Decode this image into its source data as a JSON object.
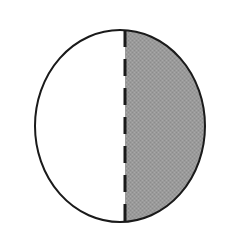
{
  "figure": {
    "name": "circle-divided-by-dashed-chord",
    "background_color": "#ffffff",
    "canvas": {
      "width": 230,
      "height": 240
    },
    "circle": {
      "center_x": 120,
      "center_y": 126,
      "radius_x": 85,
      "radius_y": 96,
      "outline_color": "#1a1a1a",
      "outline_width": 2,
      "fill_color": "#ffffff"
    },
    "divider": {
      "type": "vertical-dashed-line",
      "x": 125,
      "y_top": 30,
      "y_bottom": 222,
      "color": "#1a1a1a",
      "width": 3,
      "dash_length": 17,
      "gap_length": 12
    },
    "regions": [
      {
        "label": "left-region",
        "position": "left",
        "fill_color": "#ffffff",
        "shaded": false
      },
      {
        "label": "right-region",
        "position": "right",
        "fill_color": "#9a9a9a",
        "shaded": true
      }
    ]
  }
}
